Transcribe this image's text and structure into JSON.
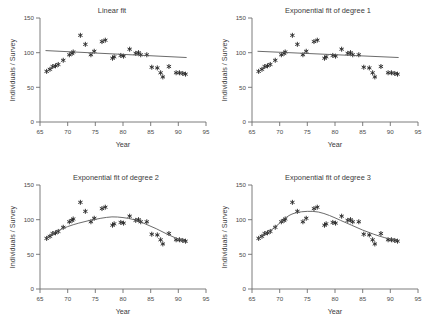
{
  "figure": {
    "panels": [
      {
        "id": "linear",
        "title": "Linear fit",
        "position": "top-left"
      },
      {
        "id": "exp1",
        "title": "Exponential fit of degree 1",
        "position": "top-right"
      },
      {
        "id": "exp2",
        "title": "Exponential fit of degree 2",
        "position": "bottom-left"
      },
      {
        "id": "exp3",
        "title": "Exponential fit of degree 3",
        "position": "bottom-right"
      }
    ]
  },
  "chart_data": [
    {
      "type": "scatter",
      "title": "Linear fit",
      "xlabel": "Year",
      "ylabel": "Individuals / Survey",
      "xlim": [
        65,
        95
      ],
      "ylim": [
        0,
        150
      ],
      "xticks": [
        65,
        70,
        75,
        80,
        85,
        90,
        95
      ],
      "yticks": [
        0,
        50,
        100,
        150
      ],
      "grid": false,
      "legend": "none",
      "marker": "asterisk",
      "series": [
        {
          "name": "Individuals per survey",
          "x": [
            66.2,
            66.8,
            67.3,
            67.8,
            68.3,
            69.2,
            70.3,
            70.8,
            71.0,
            72.3,
            73.2,
            74.2,
            74.8,
            76.2,
            76.8,
            78.1,
            78.4,
            79.6,
            80.1,
            81.2,
            82.3,
            82.8,
            83.2,
            84.3,
            85.2,
            86.2,
            86.8,
            87.2,
            88.3,
            89.6,
            90.2,
            90.8,
            91.3
          ],
          "y": [
            73,
            76,
            80,
            81,
            83,
            89,
            97,
            99,
            101,
            125,
            112,
            97,
            102,
            116,
            118,
            92,
            94,
            96,
            95,
            105,
            99,
            100,
            97,
            97,
            79,
            78,
            71,
            65,
            80,
            71,
            71,
            70,
            69
          ]
        }
      ],
      "fit": {
        "kind": "linear",
        "description": "straight line decreasing slightly from about 103 at year 66 to about 93 at year 91",
        "points": [
          [
            66,
            103
          ],
          [
            91.5,
            93
          ]
        ]
      }
    },
    {
      "type": "scatter",
      "title": "Exponential fit of degree 1",
      "xlabel": "Year",
      "ylabel": "Individuals / Survey",
      "xlim": [
        65,
        95
      ],
      "ylim": [
        0,
        150
      ],
      "xticks": [
        65,
        70,
        75,
        80,
        85,
        90,
        95
      ],
      "yticks": [
        0,
        50,
        100,
        150
      ],
      "grid": false,
      "legend": "none",
      "marker": "asterisk",
      "series": [
        {
          "name": "Individuals per survey",
          "x": [
            66.2,
            66.8,
            67.3,
            67.8,
            68.3,
            69.2,
            70.3,
            70.8,
            71.0,
            72.3,
            73.2,
            74.2,
            74.8,
            76.2,
            76.8,
            78.1,
            78.4,
            79.6,
            80.1,
            81.2,
            82.3,
            82.8,
            83.2,
            84.3,
            85.2,
            86.2,
            86.8,
            87.2,
            88.3,
            89.6,
            90.2,
            90.8,
            91.3
          ],
          "y": [
            73,
            76,
            80,
            81,
            83,
            89,
            97,
            99,
            101,
            125,
            112,
            97,
            102,
            116,
            118,
            92,
            94,
            96,
            95,
            105,
            99,
            100,
            97,
            97,
            79,
            78,
            71,
            65,
            80,
            71,
            71,
            70,
            69
          ]
        }
      ],
      "fit": {
        "kind": "exponential-degree-1",
        "description": "nearly straight gently decaying curve from about 102 at year 66 to about 93 at year 91",
        "points": [
          [
            66,
            102
          ],
          [
            91.5,
            93
          ]
        ]
      }
    },
    {
      "type": "scatter",
      "title": "Exponential fit of degree 2",
      "xlabel": "Year",
      "ylabel": "Individuals / Survey",
      "xlim": [
        65,
        95
      ],
      "ylim": [
        0,
        150
      ],
      "xticks": [
        65,
        70,
        75,
        80,
        85,
        90,
        95
      ],
      "yticks": [
        0,
        50,
        100,
        150
      ],
      "grid": false,
      "legend": "none",
      "marker": "asterisk",
      "series": [
        {
          "name": "Individuals per survey",
          "x": [
            66.2,
            66.8,
            67.3,
            67.8,
            68.3,
            69.2,
            70.3,
            70.8,
            71.0,
            72.3,
            73.2,
            74.2,
            74.8,
            76.2,
            76.8,
            78.1,
            78.4,
            79.6,
            80.1,
            81.2,
            82.3,
            82.8,
            83.2,
            84.3,
            85.2,
            86.2,
            86.8,
            87.2,
            88.3,
            89.6,
            90.2,
            90.8,
            91.3
          ],
          "y": [
            73,
            76,
            80,
            81,
            83,
            89,
            97,
            99,
            101,
            125,
            112,
            97,
            102,
            116,
            118,
            92,
            94,
            96,
            95,
            105,
            99,
            100,
            97,
            97,
            79,
            78,
            71,
            65,
            80,
            71,
            71,
            70,
            69
          ]
        }
      ],
      "fit": {
        "kind": "exponential-degree-2",
        "description": "broad dome peaking near 104 around year 78",
        "points": [
          [
            66,
            74
          ],
          [
            68,
            83
          ],
          [
            70,
            90
          ],
          [
            72,
            95
          ],
          [
            74,
            99
          ],
          [
            76,
            102
          ],
          [
            78,
            104
          ],
          [
            80,
            103
          ],
          [
            82,
            100
          ],
          [
            84,
            94
          ],
          [
            86,
            87
          ],
          [
            88,
            79
          ],
          [
            90,
            72
          ],
          [
            91.5,
            67
          ]
        ]
      }
    },
    {
      "type": "scatter",
      "title": "Exponential fit of degree 3",
      "xlabel": "Year",
      "ylabel": "Individuals / Survey",
      "xlim": [
        65,
        95
      ],
      "ylim": [
        0,
        150
      ],
      "xticks": [
        65,
        70,
        75,
        80,
        85,
        90,
        95
      ],
      "yticks": [
        0,
        50,
        100,
        150
      ],
      "grid": false,
      "legend": "none",
      "marker": "asterisk",
      "series": [
        {
          "name": "Individuals per survey",
          "x": [
            66.2,
            66.8,
            67.3,
            67.8,
            68.3,
            69.2,
            70.3,
            70.8,
            71.0,
            72.3,
            73.2,
            74.2,
            74.8,
            76.2,
            76.8,
            78.1,
            78.4,
            79.6,
            80.1,
            81.2,
            82.3,
            82.8,
            83.2,
            84.3,
            85.2,
            86.2,
            86.8,
            87.2,
            88.3,
            89.6,
            90.2,
            90.8,
            91.3
          ],
          "y": [
            73,
            76,
            80,
            81,
            83,
            89,
            97,
            99,
            101,
            125,
            112,
            97,
            102,
            116,
            118,
            92,
            94,
            96,
            95,
            105,
            99,
            100,
            97,
            97,
            79,
            78,
            71,
            65,
            80,
            71,
            71,
            70,
            69
          ]
        }
      ],
      "fit": {
        "kind": "exponential-degree-3",
        "description": "rises steeply to a plateau near 112 between years 73 and 77, then declines steadily to about 70",
        "points": [
          [
            66,
            73
          ],
          [
            68,
            82
          ],
          [
            70,
            95
          ],
          [
            71.5,
            105
          ],
          [
            73,
            110
          ],
          [
            75,
            112
          ],
          [
            77,
            111
          ],
          [
            79,
            106
          ],
          [
            81,
            99
          ],
          [
            83,
            92
          ],
          [
            85,
            85
          ],
          [
            87,
            79
          ],
          [
            89,
            74
          ],
          [
            91.5,
            70
          ]
        ]
      }
    }
  ],
  "colors": {
    "marker": "#2b2b2b",
    "fit_line": "#5a5a5a",
    "axis": "#6e6e6e",
    "text": "#3a3a3a",
    "background": "#ffffff"
  }
}
